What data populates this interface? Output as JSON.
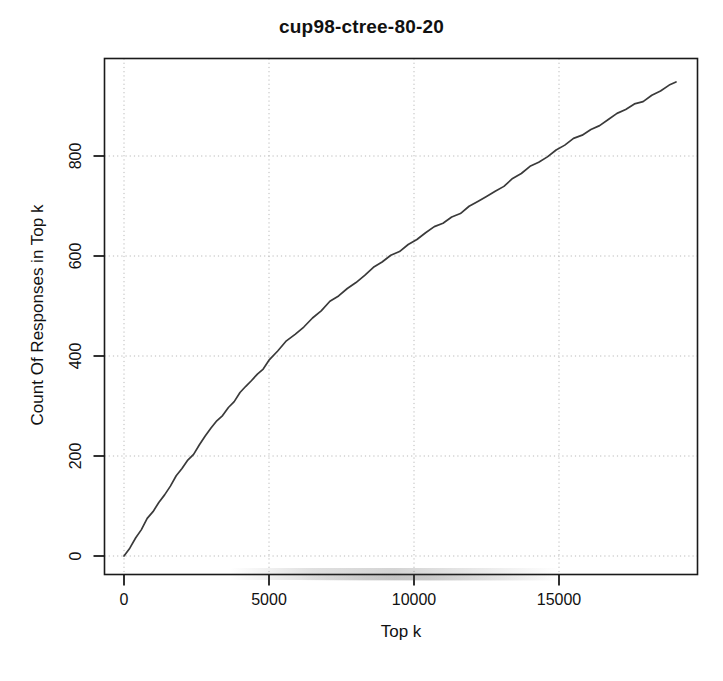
{
  "chart_data": {
    "type": "line",
    "title": "cup98-ctree-80-20",
    "xlabel": "Top k",
    "ylabel": "Count Of Responses in Top k",
    "xlim": [
      -900,
      19800
    ],
    "ylim": [
      -60,
      980
    ],
    "grid": true,
    "legend": null,
    "xticks": [
      0,
      5000,
      10000,
      15000
    ],
    "xtick_labels": [
      "0",
      "5000",
      "10000",
      "15000"
    ],
    "yticks": [
      0,
      200,
      400,
      600,
      800
    ],
    "ytick_labels": [
      "0",
      "200",
      "400",
      "600",
      "800"
    ],
    "line_color": "#3a3a3a",
    "series": [
      {
        "name": "cumulative responses",
        "x": [
          0,
          200,
          400,
          600,
          800,
          1000,
          1200,
          1400,
          1600,
          1800,
          2000,
          2200,
          2400,
          2600,
          2800,
          3000,
          3200,
          3400,
          3600,
          3800,
          4000,
          4200,
          4400,
          4600,
          4800,
          5000,
          5300,
          5600,
          5900,
          6200,
          6500,
          6800,
          7100,
          7400,
          7700,
          8000,
          8300,
          8600,
          8900,
          9200,
          9500,
          9800,
          10100,
          10400,
          10700,
          11000,
          11300,
          11600,
          11900,
          12200,
          12500,
          12800,
          13100,
          13400,
          13700,
          14000,
          14300,
          14600,
          14900,
          15200,
          15500,
          15800,
          16100,
          16400,
          16700,
          17000,
          17300,
          17600,
          17900,
          18200,
          18500,
          18800,
          19034
        ],
        "y": [
          0,
          18,
          36,
          54,
          72,
          89,
          107,
          124,
          141,
          158,
          175,
          190,
          206,
          223,
          240,
          255,
          268,
          283,
          297,
          311,
          325,
          338,
          351,
          364,
          377,
          390,
          410,
          428,
          444,
          460,
          476,
          491,
          506,
          521,
          535,
          549,
          562,
          575,
          588,
          600,
          612,
          623,
          633,
          645,
          657,
          668,
          678,
          687,
          697,
          708,
          719,
          730,
          742,
          753,
          765,
          777,
          789,
          800,
          812,
          822,
          832,
          843,
          853,
          863,
          873,
          883,
          893,
          903,
          912,
          921,
          930,
          940,
          948
        ]
      }
    ]
  },
  "artifacts": {
    "ghost_line_1": "",
    "ghost_line_2": ""
  }
}
